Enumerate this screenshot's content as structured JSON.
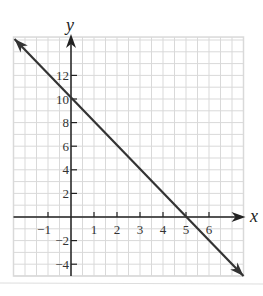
{
  "chart_data": {
    "type": "line",
    "title": "",
    "xlabel": "x",
    "ylabel": "y",
    "xlim": [
      -2.5,
      7.5
    ],
    "ylim": [
      -5,
      15.25
    ],
    "grid": true,
    "grid_minor_step_x": 0.5,
    "grid_minor_step_y": 1,
    "x_ticks": [
      -1,
      1,
      2,
      3,
      4,
      5,
      6
    ],
    "x_tick_labels": [
      "−1",
      "1",
      "2",
      "3",
      "4",
      "5",
      "6"
    ],
    "y_ticks": [
      -4,
      -2,
      2,
      4,
      6,
      8,
      10,
      12
    ],
    "y_tick_labels": [
      "−4",
      "−2",
      "2",
      "4",
      "6",
      "8",
      "10",
      "12"
    ],
    "series": [
      {
        "name": "line",
        "equation": "y = -2x + 10",
        "x": [
          -2.5,
          0,
          5,
          7.5
        ],
        "y": [
          15,
          10,
          0,
          -5
        ],
        "arrows_both_ends": true,
        "color": "#333333"
      }
    ],
    "annotations": {
      "y_intercept": [
        0,
        10
      ],
      "x_intercept": [
        5,
        0
      ]
    },
    "legend": null
  },
  "colors": {
    "grid": "#d9d9d9",
    "axis": "#222222",
    "line": "#333333",
    "separator": "#dddddd"
  }
}
